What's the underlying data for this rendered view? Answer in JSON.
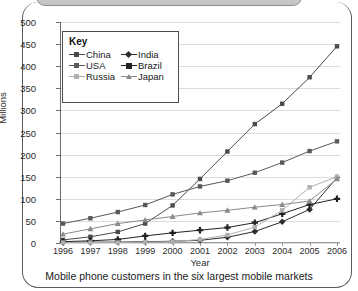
{
  "figure": {
    "caption": "Mobile phone customers in the six largest mobile markets",
    "cropped_banner_present": true
  },
  "chart_data": {
    "type": "line",
    "title": "",
    "xlabel": "Year",
    "ylabel": "Millions",
    "grid": true,
    "legend_position": "inside-top-left",
    "legend_title": "Key",
    "categories": [
      "1996",
      "1997",
      "1998",
      "1999",
      "2000",
      "2001",
      "2002",
      "2003",
      "2004",
      "2005",
      "2006"
    ],
    "xlim": [
      1996,
      2006
    ],
    "ylim": [
      0,
      500
    ],
    "ytick_labels": [
      "0",
      "50",
      "100",
      "150",
      "200",
      "250",
      "300",
      "350",
      "400",
      "450",
      "500"
    ],
    "yticks": [
      0,
      50,
      100,
      150,
      200,
      250,
      300,
      350,
      400,
      450,
      500
    ],
    "series": [
      {
        "name": "China",
        "color": "#4a4a4a",
        "marker": "square",
        "values": [
          7,
          14,
          25,
          44,
          85,
          145,
          207,
          269,
          315,
          375,
          445
        ]
      },
      {
        "name": "India",
        "color": "#2c2c2c",
        "marker": "diamond",
        "values": [
          1,
          2,
          2,
          3,
          4,
          6,
          13,
          26,
          48,
          76,
          148
        ]
      },
      {
        "name": "USA",
        "color": "#595959",
        "marker": "square",
        "values": [
          44,
          56,
          70,
          86,
          110,
          128,
          141,
          159,
          182,
          208,
          230
        ]
      },
      {
        "name": "Brazil",
        "color": "#222222",
        "marker": "cross",
        "values": [
          3,
          5,
          8,
          16,
          23,
          29,
          35,
          46,
          66,
          87,
          100
        ]
      },
      {
        "name": "Russia",
        "color": "#b0b0b0",
        "marker": "square",
        "values": [
          1,
          1,
          1,
          2,
          3,
          8,
          18,
          36,
          74,
          126,
          150
        ]
      },
      {
        "name": "Japan",
        "color": "#8a8a8a",
        "marker": "triangle",
        "values": [
          20,
          32,
          44,
          52,
          60,
          68,
          74,
          81,
          87,
          95,
          145
        ]
      }
    ]
  }
}
